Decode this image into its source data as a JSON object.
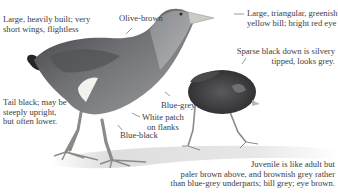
{
  "figure": {
    "colors": {
      "plumage_dark": "#2f2f33",
      "plumage_mid": "#6b6d70",
      "plumage_light": "#a9abad",
      "bill": "#c9cbc7",
      "flank_patch": "#f2f2ee",
      "ground_shadow": "#d6d6d6",
      "text": "#3d3d3d"
    }
  },
  "annotations": {
    "build": [
      "Large, heavily built; very",
      "short wings, flightless"
    ],
    "back": "Olive-brown",
    "bill": [
      "Large, triangular, greenish",
      "yellow bill; bright red eye"
    ],
    "chick_down": [
      "Sparse black down is silvery",
      "tipped, looks grey."
    ],
    "tail": [
      "Tail black; may be",
      "steeply upright,",
      "but often lower."
    ],
    "breast": "Blue-grey",
    "flank": [
      "White patch",
      "on flanks"
    ],
    "belly": "Blue-black",
    "juvenile": [
      "Juvenile is like adult but",
      "paler brown above, and brownish grey rather",
      "than blue-grey underparts; bill grey; eye brown."
    ]
  }
}
